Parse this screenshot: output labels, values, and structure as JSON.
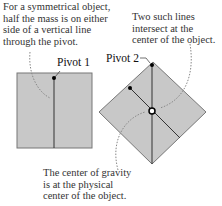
{
  "annotations": {
    "left_top": [
      "For a symmetrical object,",
      "half the mass is on either",
      "side of a vertical line",
      "through the pivot."
    ],
    "right_top": [
      "Two such lines",
      "intersect at the",
      "center of the object."
    ],
    "bottom": [
      "The center of gravity",
      "is at the physical",
      "center of the object."
    ]
  },
  "labels": {
    "pivot1": "Pivot 1",
    "pivot2": "Pivot 2"
  },
  "colors": {
    "fill": "#c8c8c8",
    "stroke": "#777777",
    "line": "#333333",
    "dots": "#888888"
  }
}
